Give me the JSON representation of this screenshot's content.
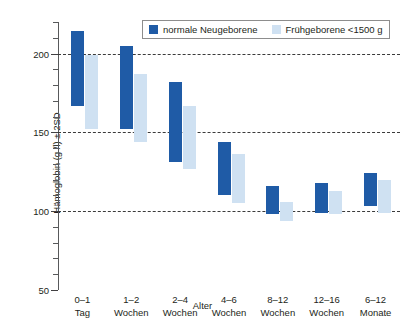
{
  "chart_data": {
    "type": "bar",
    "title": "",
    "subtitle": "",
    "xlabel": "Alter",
    "ylabel": "Hämoglobin (g /l) ± 2SD",
    "ylim": [
      50,
      220
    ],
    "yticks": [
      50,
      100,
      150,
      200
    ],
    "ytick_labels": [
      "50",
      "100",
      "150",
      "200"
    ],
    "minor_ytick_step": 10,
    "grid": "horizontal dashed at 100, 150, 200",
    "legend_position": "top-center",
    "orientation": "vertical",
    "bar_style": "floating range bars (min-max / ±2SD interval)",
    "categories": [
      "0–1 Tag",
      "1–2 Wochen",
      "2–4 Wochen",
      "4–6 Wochen",
      "8–12 Wochen",
      "12–16 Wochen",
      "6–12 Monate"
    ],
    "category_lines": [
      [
        "0–1",
        "Tag"
      ],
      [
        "1–2",
        "Wochen"
      ],
      [
        "2–4",
        "Wochen"
      ],
      [
        "4–6",
        "Wochen"
      ],
      [
        "8–12",
        "Wochen"
      ],
      [
        "12–16",
        "Wochen"
      ],
      [
        "6–12",
        "Monate"
      ]
    ],
    "series": [
      {
        "name": "normale Neugeborene",
        "color": "#1f5ba6",
        "ranges": [
          {
            "low": 167,
            "high": 214
          },
          {
            "low": 152,
            "high": 205
          },
          {
            "low": 131,
            "high": 182
          },
          {
            "low": 110,
            "high": 144
          },
          {
            "low": 98,
            "high": 116
          },
          {
            "low": 99,
            "high": 118
          },
          {
            "low": 103,
            "high": 124
          }
        ]
      },
      {
        "name": "Frühgeborene <1500 g",
        "color": "#cfe1f2",
        "ranges": [
          {
            "low": 152,
            "high": 199
          },
          {
            "low": 144,
            "high": 187
          },
          {
            "low": 127,
            "high": 167
          },
          {
            "low": 105,
            "high": 136
          },
          {
            "low": 94,
            "high": 106
          },
          {
            "low": 98,
            "high": 113
          },
          {
            "low": 99,
            "high": 120
          }
        ]
      }
    ]
  },
  "legend": {
    "entries": [
      {
        "label": "normale Neugeborene",
        "color": "#1f5ba6"
      },
      {
        "label": "Frühgeborene <1500 g",
        "color": "#cfe1f2"
      }
    ]
  },
  "axes": {
    "y_title": "Hämoglobin (g /l) ± 2SD",
    "x_title": "Alter",
    "y_tick_0": "200",
    "y_tick_1": "150",
    "y_tick_2": "100",
    "y_tick_3": "50"
  },
  "colors": {
    "dark_blue": "#1f5ba6",
    "light_blue": "#cfe1f2",
    "axis": "#58595b",
    "grid": "#3b3b3b",
    "background": "#ffffff"
  }
}
